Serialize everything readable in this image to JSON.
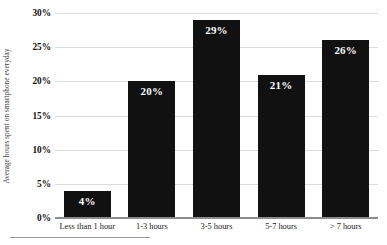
{
  "chart_data": {
    "type": "bar",
    "title": "",
    "xlabel": "",
    "ylabel": "Average hours spent on smartphone everyday",
    "categories": [
      "Less than 1 hour",
      "1-3 hours",
      "3-5 hours",
      "5-7 hours",
      "> 7 hours"
    ],
    "values": [
      4,
      20,
      29,
      21,
      26
    ],
    "data_labels": [
      "4%",
      "20%",
      "29%",
      "21%",
      "26%"
    ],
    "ylim": [
      0,
      30
    ],
    "y_ticks": [
      0,
      5,
      10,
      15,
      20,
      25,
      30
    ],
    "y_tick_labels": [
      "0%",
      "5%",
      "10%",
      "15%",
      "20%",
      "25%",
      "30%"
    ],
    "grid": true,
    "legend": false,
    "legend_position": "none",
    "bar_color": "#111111",
    "gridline_color": "#dcdcdc",
    "axis_color": "#8c8c8c",
    "data_label_color": "#ffffff"
  }
}
